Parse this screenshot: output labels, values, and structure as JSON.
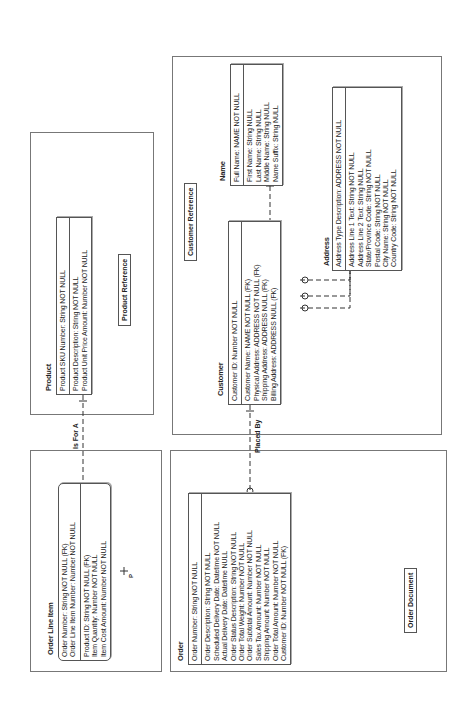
{
  "subject_areas": {
    "product_reference": "Product Reference",
    "customer_reference": "Customer Reference",
    "order_document": "Order Document"
  },
  "entities": {
    "product": {
      "name": "Product",
      "keys": [
        "Product SKU Number: String NOT NULL"
      ],
      "attributes": [
        "Product Description: String NOT NULL",
        "Product Unit Price Amount: Number NOT NULL"
      ]
    },
    "order_line_item": {
      "name": "Order Line Item",
      "keys": [
        "Order Number: String NOT NULL (FK)",
        "Order Line Item Number: Number NOT NULL"
      ],
      "attributes": [
        "Product ID: String NOT NULL (FK)",
        "Item Quantity: Number NOT NULL",
        "Item Cost Amount: Number NOT NULL"
      ]
    },
    "order": {
      "name": "Order",
      "keys": [
        "Order Number: String NOT NULL"
      ],
      "attributes": [
        "Order Description: String NOT NULL",
        "Scheduled Delivery Date: Datetime NOT NULL",
        "Actual Delivery Date: Datetime NULL",
        "Order Status Description: String NOT NULL",
        "Order Total Weight: Number NOT NULL",
        "Order Subtotal Amount: Number NOT NULL",
        "Sales Tax Amount: Number NOT NULL",
        "Shipping Amount: Number NOT NULL",
        "Order Total Amount: Number NOT NULL",
        "Customer ID: Number NOT NULL (FK)"
      ]
    },
    "customer": {
      "name": "Customer",
      "keys": [
        "Customer ID: Number NOT NULL"
      ],
      "attributes": [
        "Customer Name: NAME NOT NULL (FK)",
        "Physical Address: ADDRESS NOT NULL (FK)",
        "Shipping Address: ADDRESS NULL (FK)",
        "Billing Address: ADDRESS NULL (FK)"
      ]
    },
    "name": {
      "name": "Name",
      "keys": [
        "Full Name: NAME NOT NULL"
      ],
      "attributes": [
        "First Name: String NULL",
        "Last Name: String NULL",
        "Middle Name: String NULL",
        "Name Suffix: String NULL"
      ]
    },
    "address": {
      "name": "Address",
      "keys": [
        "Address Type Description: ADDRESS NOT NULL"
      ],
      "attributes": [
        "Address Line 1 Text: String NOT NULL",
        "Address Line 2 Text: String NULL",
        "State/Province Code: String NOT NULL",
        "Postal Code: String NOT NULL",
        "City Name: String NOT NULL",
        "Country Code: String NOT NULL"
      ]
    }
  },
  "relationships": {
    "is_for_a": "Is For A",
    "placed_by": "Placed By",
    "includes_name": "Includes",
    "includes_address": "Includes",
    "may_include_1": "May Include",
    "may_include_2": "May Include",
    "cardinality_p": "P",
    "cardinality_1": "1"
  }
}
